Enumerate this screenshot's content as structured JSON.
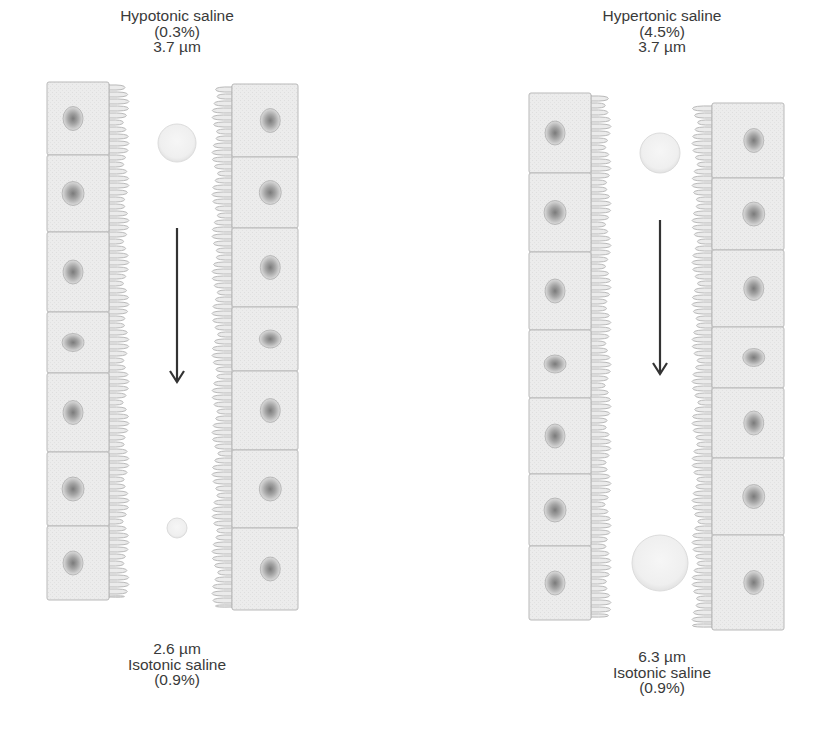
{
  "colors": {
    "cell_fill": "#ebebeb",
    "cell_border": "#b9b9b9",
    "nucleus_ring": "#a8a8a8",
    "nucleus_core": "#7a7a7a",
    "droplet_fill": "#f1f1f1",
    "droplet_edge": "#dcdcdc",
    "arrow": "#333333",
    "text": "#3a3a3a"
  },
  "panels": [
    {
      "id": "hypotonic",
      "top_label": {
        "solution": "Hypotonic saline",
        "concentration": "(0.3%)",
        "droplet_size": "3.7 µm"
      },
      "bottom_label": {
        "droplet_size": "2.6 µm",
        "solution": "Isotonic saline",
        "concentration": "(0.9%)"
      },
      "droplet_start_um": 3.7,
      "droplet_end_um": 2.6,
      "left_column": {
        "x": 47,
        "w": 62,
        "cells": [
          [
            82,
            155
          ],
          [
            155,
            232
          ],
          [
            232,
            312
          ],
          [
            312,
            373
          ],
          [
            373,
            452
          ],
          [
            452,
            526
          ],
          [
            526,
            600
          ]
        ]
      },
      "right_column": {
        "x": 232,
        "w": 66,
        "cells": [
          [
            84,
            157
          ],
          [
            157,
            228
          ],
          [
            228,
            307
          ],
          [
            307,
            371
          ],
          [
            371,
            450
          ],
          [
            450,
            528
          ],
          [
            528,
            610
          ]
        ]
      },
      "droplet_top": {
        "cx": 177,
        "cy": 143,
        "r": 19
      },
      "droplet_bottom": {
        "cx": 177,
        "cy": 528,
        "r": 10
      },
      "arrow": {
        "x": 177,
        "y1": 228,
        "y2": 382
      }
    },
    {
      "id": "hypertonic",
      "top_label": {
        "solution": "Hypertonic saline",
        "concentration": "(4.5%)",
        "droplet_size": "3.7 µm"
      },
      "bottom_label": {
        "droplet_size": "6.3 µm",
        "solution": "Isotonic saline",
        "concentration": "(0.9%)"
      },
      "droplet_start_um": 3.7,
      "droplet_end_um": 6.3,
      "left_column": {
        "x": 529,
        "w": 62,
        "cells": [
          [
            93,
            173
          ],
          [
            173,
            252
          ],
          [
            252,
            330
          ],
          [
            330,
            398
          ],
          [
            398,
            474
          ],
          [
            474,
            546
          ],
          [
            546,
            620
          ]
        ]
      },
      "right_column": {
        "x": 712,
        "w": 72,
        "cells": [
          [
            103,
            178
          ],
          [
            178,
            250
          ],
          [
            250,
            327
          ],
          [
            327,
            388
          ],
          [
            388,
            458
          ],
          [
            458,
            535
          ],
          [
            535,
            630
          ]
        ]
      },
      "droplet_top": {
        "cx": 660,
        "cy": 153,
        "r": 20
      },
      "droplet_bottom": {
        "cx": 660,
        "cy": 563,
        "r": 28
      },
      "arrow": {
        "x": 660,
        "y1": 220,
        "y2": 374
      }
    }
  ]
}
